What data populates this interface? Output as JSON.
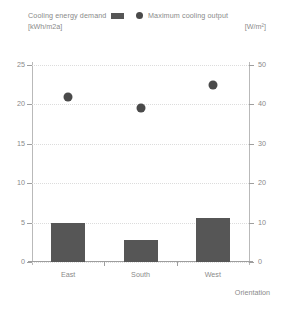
{
  "legend": {
    "left": {
      "label": "Cooling energy demand",
      "unit": "[kWh/m2a]",
      "marker": "bar-swatch",
      "color": "#565656"
    },
    "right": {
      "label": "Maximum cooling output",
      "unit": "[W/m²]",
      "marker": "dot-swatch",
      "color": "#4a4a4a"
    }
  },
  "chart_data": {
    "type": "bar",
    "title": "",
    "categories": [
      "East",
      "South",
      "West"
    ],
    "series": [
      {
        "name": "Cooling energy demand",
        "type": "bar",
        "axis": "left",
        "unit": "kWh/m2a",
        "color": "#565656",
        "values": [
          5.0,
          2.8,
          5.6
        ]
      },
      {
        "name": "Maximum cooling output",
        "type": "scatter",
        "axis": "right",
        "unit": "W/m²",
        "color": "#4a4a4a",
        "values": [
          41.8,
          39.2,
          44.8
        ]
      }
    ],
    "xlabel": "Orientation",
    "ylabel": "",
    "ylim": [
      0,
      25
    ],
    "yticks": [
      "0",
      "5",
      "10",
      "15",
      "20",
      "25"
    ],
    "y2label": "",
    "y2lim": [
      0,
      50
    ],
    "y2ticks": [
      "0",
      "10",
      "20",
      "30",
      "40",
      "50"
    ],
    "grid": true,
    "legend_position": "top"
  }
}
